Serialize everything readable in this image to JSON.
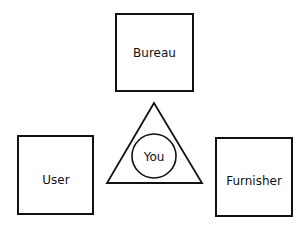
{
  "diagram": {
    "nodes": [
      {
        "id": "bureau",
        "label": "Bureau",
        "shape": "square"
      },
      {
        "id": "user",
        "label": "User",
        "shape": "square"
      },
      {
        "id": "furnisher",
        "label": "Furnisher",
        "shape": "square"
      },
      {
        "id": "you",
        "label": "You",
        "shape": "circle-in-triangle"
      }
    ],
    "colors": {
      "stroke": "#111111",
      "background": "#ffffff"
    }
  }
}
